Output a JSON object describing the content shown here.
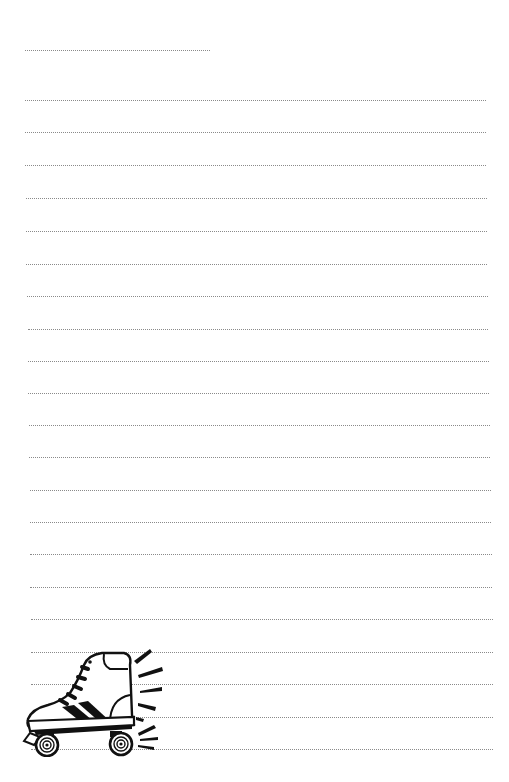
{
  "page": {
    "type": "lined-writing-paper",
    "background": "#ffffff",
    "rule_color": "#8a8a8a",
    "name_line": {
      "x1": 25,
      "x2": 210,
      "y": 50
    },
    "lines": [
      {
        "y": 100,
        "x1": 25,
        "x2": 486
      },
      {
        "y": 132,
        "x1": 25,
        "x2": 486
      },
      {
        "y": 165,
        "x1": 25,
        "x2": 486
      },
      {
        "y": 198,
        "x1": 26,
        "x2": 487
      },
      {
        "y": 231,
        "x1": 26,
        "x2": 487
      },
      {
        "y": 264,
        "x1": 26,
        "x2": 487
      },
      {
        "y": 296,
        "x1": 27,
        "x2": 488
      },
      {
        "y": 329,
        "x1": 28,
        "x2": 488
      },
      {
        "y": 361,
        "x1": 28,
        "x2": 489
      },
      {
        "y": 393,
        "x1": 28,
        "x2": 489
      },
      {
        "y": 425,
        "x1": 29,
        "x2": 490
      },
      {
        "y": 457,
        "x1": 29,
        "x2": 490
      },
      {
        "y": 490,
        "x1": 30,
        "x2": 491
      },
      {
        "y": 522,
        "x1": 30,
        "x2": 491
      },
      {
        "y": 554,
        "x1": 30,
        "x2": 492
      },
      {
        "y": 587,
        "x1": 30,
        "x2": 492
      },
      {
        "y": 619,
        "x1": 31,
        "x2": 493
      },
      {
        "y": 652,
        "x1": 31,
        "x2": 493
      },
      {
        "y": 684,
        "x1": 31,
        "x2": 493
      },
      {
        "y": 717,
        "x1": 31,
        "x2": 493
      },
      {
        "y": 749,
        "x1": 31,
        "x2": 493
      }
    ],
    "illustration": {
      "name": "roller-skate",
      "style": "black line art",
      "position": "bottom-left"
    }
  }
}
